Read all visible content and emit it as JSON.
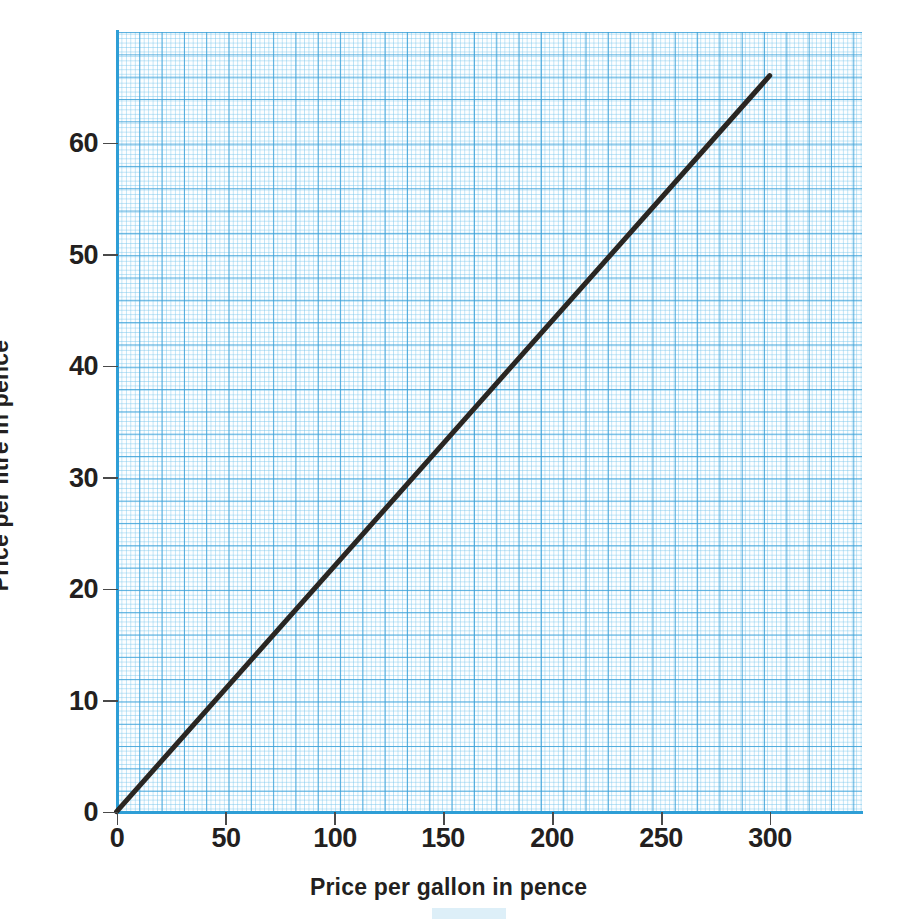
{
  "chart_data": {
    "type": "line",
    "title": "",
    "subtitle": "",
    "xlabel": "Price per gallon in pence",
    "ylabel": "Price per litre in pence",
    "xlim": [
      0,
      340
    ],
    "ylim": [
      0,
      67.5
    ],
    "xticks": [
      0,
      50,
      100,
      150,
      200,
      250,
      300
    ],
    "xticklabels": [
      "0",
      "50",
      "100",
      "150",
      "200",
      "250",
      "300"
    ],
    "yticks": [
      0,
      10,
      20,
      30,
      40,
      50,
      60
    ],
    "yticklabels": [
      "0",
      "10",
      "20",
      "30",
      "40",
      "50",
      "60"
    ],
    "grid": true,
    "grid_style": "graph-paper, minor every 2.24 x-units / 0.2 y-units, major every 5 minor cells",
    "legend": "none",
    "series": [
      {
        "name": "gallon-to-litre conversion",
        "x": [
          0,
          300
        ],
        "y": [
          0,
          66
        ],
        "points": [
          {
            "x": 0,
            "y": 0
          },
          {
            "x": 50,
            "y": 11
          },
          {
            "x": 100,
            "y": 22
          },
          {
            "x": 150,
            "y": 33
          },
          {
            "x": 200,
            "y": 44
          },
          {
            "x": 250,
            "y": 55
          },
          {
            "x": 300,
            "y": 66
          }
        ],
        "slope": 0.22,
        "intercept": 0,
        "color": "#2a2622",
        "linewidth": 5
      }
    ],
    "annotations": []
  },
  "figure": {
    "top_cutoff_text": "",
    "axis": {
      "x_title": "Price per gallon in pence",
      "y_title": "Price per litre in pence"
    },
    "colors": {
      "grid_major": "#3aa0d8",
      "grid_minor": "#79c6ec",
      "axis_spine": "#2e9ed6",
      "data_line": "#2a2622",
      "tick_label": "#231f20",
      "paper": "#fdfeff",
      "background": "#ffffff"
    }
  }
}
